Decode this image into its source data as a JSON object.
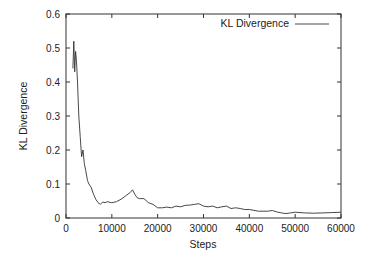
{
  "chart_data": {
    "type": "line",
    "title": "",
    "xlabel": "Steps",
    "ylabel": "KL Divergence",
    "xlim": [
      0,
      60000
    ],
    "ylim": [
      0,
      0.6
    ],
    "xticks": [
      0,
      10000,
      20000,
      30000,
      40000,
      50000,
      60000
    ],
    "yticks": [
      0,
      0.1,
      0.2,
      0.3,
      0.4,
      0.5,
      0.6
    ],
    "xtick_labels": [
      "0",
      "10000",
      "20000",
      "30000",
      "40000",
      "50000",
      "60000"
    ],
    "ytick_labels": [
      "0",
      "0.1",
      "0.2",
      "0.3",
      "0.4",
      "0.5",
      "0.6"
    ],
    "grid": false,
    "legend_position": "top-right",
    "series": [
      {
        "name": "KL Divergence",
        "color": "#333333",
        "x": [
          1500,
          1700,
          1900,
          2100,
          2300,
          2500,
          2800,
          3100,
          3400,
          3700,
          4000,
          4300,
          4700,
          5000,
          5500,
          6000,
          6500,
          7000,
          7500,
          8000,
          8500,
          9000,
          10000,
          11000,
          12000,
          13000,
          14000,
          14500,
          15000,
          15500,
          16000,
          17000,
          18000,
          19000,
          20000,
          21000,
          22000,
          23000,
          24000,
          25000,
          26000,
          27000,
          28000,
          29000,
          30000,
          31000,
          32000,
          33000,
          34000,
          35000,
          36000,
          37000,
          38000,
          39000,
          40000,
          42000,
          44000,
          45000,
          46000,
          47000,
          48000,
          49000,
          50000,
          52000,
          54000,
          56000,
          58000,
          60000
        ],
        "values": [
          0.44,
          0.52,
          0.43,
          0.49,
          0.46,
          0.4,
          0.3,
          0.24,
          0.18,
          0.2,
          0.16,
          0.14,
          0.11,
          0.1,
          0.09,
          0.07,
          0.055,
          0.045,
          0.04,
          0.047,
          0.045,
          0.048,
          0.045,
          0.048,
          0.055,
          0.065,
          0.075,
          0.083,
          0.07,
          0.06,
          0.057,
          0.057,
          0.045,
          0.04,
          0.03,
          0.03,
          0.032,
          0.03,
          0.035,
          0.033,
          0.037,
          0.038,
          0.04,
          0.042,
          0.035,
          0.033,
          0.035,
          0.03,
          0.033,
          0.035,
          0.028,
          0.03,
          0.028,
          0.025,
          0.025,
          0.02,
          0.02,
          0.022,
          0.018,
          0.015,
          0.013,
          0.015,
          0.017,
          0.015,
          0.014,
          0.015,
          0.016,
          0.017
        ]
      }
    ]
  }
}
